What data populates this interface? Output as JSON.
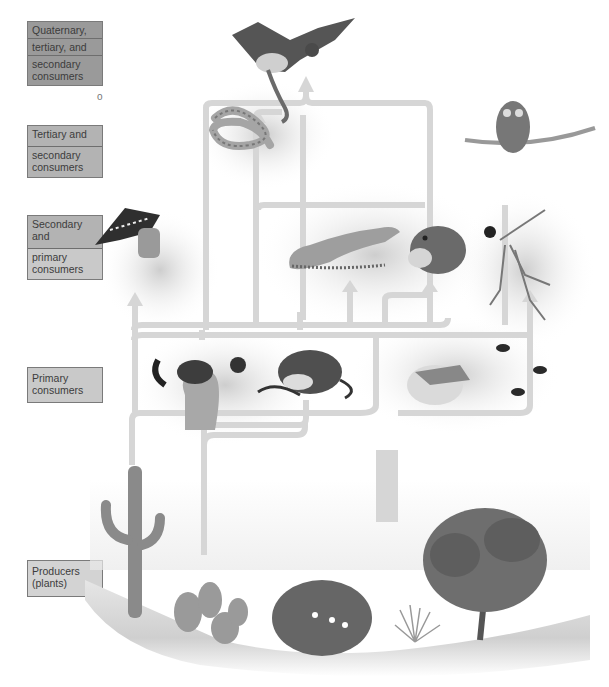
{
  "diagram": {
    "type": "food web",
    "ecosystem": "desert",
    "trophic_labels": [
      {
        "id": "quaternary",
        "segments": [
          "Quaternary,",
          "tertiary, and",
          "secondary consumers"
        ]
      },
      {
        "id": "tertiary",
        "segments": [
          "Tertiary and",
          "secondary consumers"
        ]
      },
      {
        "id": "secondary",
        "segments": [
          "Secondary and",
          "primary consumers"
        ]
      },
      {
        "id": "primary",
        "segments": [
          "Primary consumers"
        ]
      },
      {
        "id": "producers",
        "segments": [
          "Producers (plants)"
        ]
      }
    ],
    "stray_char": "o",
    "organisms": {
      "top": [
        "hawk"
      ],
      "tertiary": [
        "rattlesnake",
        "owl"
      ],
      "secondary": [
        "woodpecker",
        "lizard",
        "kangaroo rat (predator)",
        "mantis with insect"
      ],
      "primary": [
        "ground squirrel",
        "pocket mouse",
        "grasshopper",
        "ants"
      ],
      "producers": [
        "saguaro cactus",
        "prickly pear cactus",
        "flowering shrub",
        "grass clump",
        "mesquite tree"
      ]
    },
    "colors": {
      "arrow": "#d6d6d6",
      "label_dark": "#9a9a9a",
      "label_mid": "#b3b3b3",
      "label_light": "#c9c9c9",
      "label_border": "#7a7a7a",
      "text": "#3c3c3c"
    }
  }
}
